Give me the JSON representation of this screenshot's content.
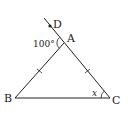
{
  "figure": {
    "type": "geometry-triangle",
    "points": {
      "A": {
        "label": "A",
        "x": 64,
        "y": 43
      },
      "B": {
        "label": "B",
        "x": 15,
        "y": 98
      },
      "C": {
        "label": "C",
        "x": 110,
        "y": 98
      },
      "D": {
        "label": "D",
        "x": 50,
        "y": 27
      }
    },
    "angle_exterior_label": "100°",
    "angle_unknown_label": "x",
    "equal_sides": [
      "AB",
      "AC"
    ],
    "colors": {
      "stroke": "#222222",
      "background": "#ffffff"
    }
  }
}
